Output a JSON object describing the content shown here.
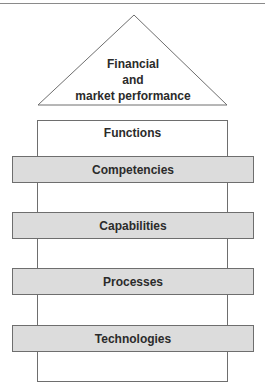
{
  "diagram": {
    "apex": {
      "lines": [
        "Financial",
        "and",
        "market performance"
      ]
    },
    "frame": {
      "title": "Functions"
    },
    "layers": [
      {
        "label": "Competencies",
        "top": 156
      },
      {
        "label": "Capabilities",
        "top": 212
      },
      {
        "label": "Processes",
        "top": 268
      },
      {
        "label": "Technologies",
        "top": 325
      }
    ],
    "colors": {
      "bar_fill": "#dcdcdc",
      "stroke": "#6e6e6e",
      "text": "#2b2b2b"
    }
  }
}
